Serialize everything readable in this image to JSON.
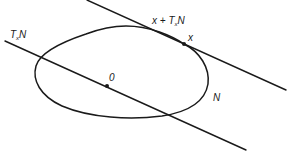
{
  "diagram": {
    "type": "geometric-figure",
    "colors": {
      "ink": "#1a1a1a",
      "background": "#ffffff"
    },
    "labels": {
      "tangent_space": {
        "main": "T",
        "sub": "x",
        "tail": "N"
      },
      "affine_tangent": {
        "prefix": "x + ",
        "main": "T",
        "sub": "x",
        "tail": "N"
      },
      "point_x": "x",
      "origin": "0",
      "curve": "N"
    },
    "points": {
      "x": {
        "cx": 184,
        "cy": 44
      },
      "origin": {
        "cx": 107,
        "cy": 86
      }
    },
    "lines": {
      "tangent_space_line": {
        "x1": 5,
        "y1": 41,
        "x2": 246,
        "y2": 150
      },
      "affine_tangent_line": {
        "x1": 87,
        "y1": 0,
        "x2": 286,
        "y2": 90
      }
    }
  }
}
